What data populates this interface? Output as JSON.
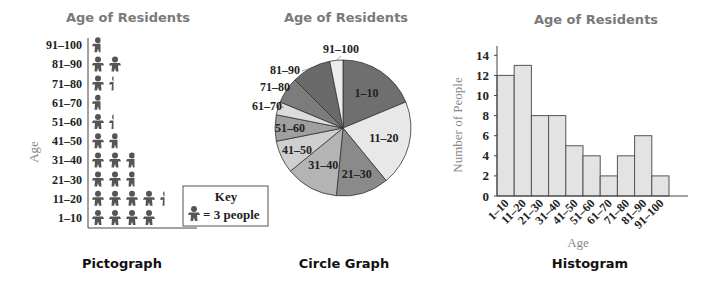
{
  "chart_data": [
    {
      "type": "pictograph",
      "title": "Age of Residents",
      "caption": "Pictograph",
      "ylabel": "Age",
      "categories": [
        "1–10",
        "11–20",
        "21–30",
        "31–40",
        "41–50",
        "51–60",
        "61–70",
        "71–80",
        "81–90",
        "91–100"
      ],
      "values": [
        12,
        13,
        8,
        8,
        5,
        4,
        2,
        4,
        6,
        2
      ],
      "key": {
        "title": "Key",
        "text": "= 3 people",
        "unit": 3
      }
    },
    {
      "type": "pie",
      "title": "Age of Residents",
      "caption": "Circle Graph",
      "categories": [
        "1–10",
        "11–20",
        "21–30",
        "31–40",
        "41–50",
        "51–60",
        "61–70",
        "71–80",
        "81–90",
        "91–100"
      ],
      "values": [
        12,
        13,
        8,
        8,
        5,
        4,
        2,
        4,
        6,
        2
      ],
      "colors": [
        "#6f6f6f",
        "#e8e8e8",
        "#8a8a8a",
        "#b4b4b4",
        "#cfcfcf",
        "#a0a0a0",
        "#dcdcdc",
        "#7c7c7c",
        "#6a6a6a",
        "#ececec"
      ]
    },
    {
      "type": "bar",
      "title": "Age of Residents",
      "caption": "Histogram",
      "xlabel": "Age",
      "ylabel": "Number of People",
      "categories": [
        "1–10",
        "11–20",
        "21–30",
        "31–40",
        "41–50",
        "51–60",
        "61–70",
        "71–80",
        "81–90",
        "91–100"
      ],
      "values": [
        12,
        13,
        8,
        8,
        5,
        4,
        2,
        4,
        6,
        2
      ],
      "yticks": [
        0,
        2,
        4,
        6,
        8,
        10,
        12,
        14
      ],
      "ylim": [
        0,
        14
      ],
      "grid": false
    }
  ]
}
